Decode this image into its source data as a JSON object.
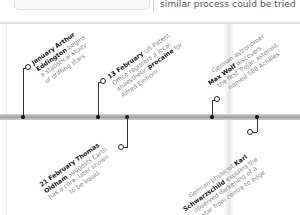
{
  "header": {
    "snippet_text": "similar process could be tried"
  },
  "timeline": {
    "events": [
      {
        "date": "January",
        "lines": [
          "Arthur",
          "Eddington begins",
          "a statistical study",
          "of drifting stars"
        ],
        "bold": "January Arthur Eddington",
        "position": "above"
      },
      {
        "date": "13 February",
        "lines": [
          "US Patent",
          "Office registers a local",
          "anaesthetic procaine for",
          "Alfred Einhorn"
        ],
        "bold": "13 February, procaine",
        "position": "above"
      },
      {
        "date": "21 February",
        "lines": [
          "Thomas",
          "Oldham suggests Earth",
          "has a core, later shown",
          "to be liquid"
        ],
        "bold": "21 February Thomas Oldham",
        "position": "below"
      },
      {
        "date": "",
        "lines": [
          "German astronomer",
          "Max Wolf discovers",
          "the first Trojan asteroid,",
          "named 588 Achilles"
        ],
        "bold": "Max Wolf",
        "position": "above"
      },
      {
        "date": "",
        "lines": [
          "German physicist Karl",
          "Schwarzschild explains the",
          "observed darkening of a",
          "star from centre to edge"
        ],
        "bold": "Karl Schwarzschild",
        "position": "below"
      }
    ]
  },
  "colors": {
    "timeline_bar": "#a8a8a8",
    "marker": "#222222",
    "text_bold": "#222222",
    "text_normal": "#8a8a8a"
  }
}
